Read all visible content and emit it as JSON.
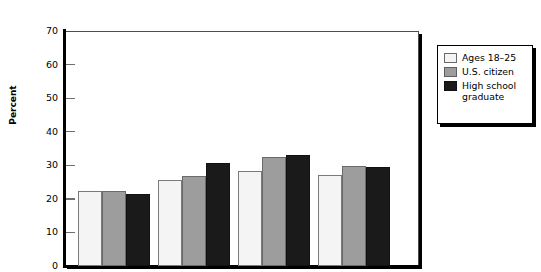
{
  "chart_data": {
    "type": "bar",
    "title": "",
    "subtitle": "",
    "xlabel": "",
    "ylabel": "Percent",
    "ylim": [
      0,
      70
    ],
    "ytick_labels": [
      "70",
      "60",
      "50",
      "40",
      "30",
      "20",
      "10",
      "0"
    ],
    "ytick_values": [
      70,
      60,
      50,
      40,
      30,
      20,
      10,
      0
    ],
    "grid": false,
    "legend_position": "right-outside",
    "categories": [
      "",
      "",
      "",
      ""
    ],
    "series": [
      {
        "name": "Ages 18–25",
        "color": "#f4f4f4",
        "values": [
          22.2,
          25.5,
          28.4,
          27.1
        ]
      },
      {
        "name": "U.S. citizen",
        "color": "#9d9d9d",
        "values": [
          22.2,
          26.8,
          32.5,
          29.9
        ]
      },
      {
        "name": "High school graduate",
        "color": "#1a1a1a",
        "values": [
          21.5,
          30.8,
          33.2,
          29.4
        ]
      }
    ]
  },
  "axis": {
    "y_title": "Percent"
  },
  "legend": {
    "items": [
      {
        "label": "Ages 18–25",
        "swatch": "white-swatch"
      },
      {
        "label": "U.S. citizen",
        "swatch": "gray-swatch"
      },
      {
        "label": "High school\ngraduate",
        "swatch": "black-swatch"
      }
    ]
  }
}
